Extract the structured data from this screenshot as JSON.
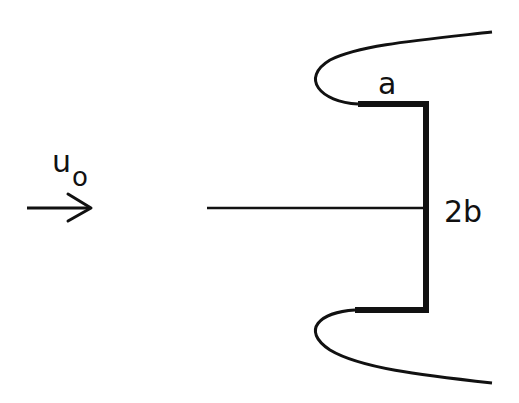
{
  "diagram": {
    "labels": {
      "velocity": "u",
      "velocity_subscript": "o",
      "plate_length": "a",
      "gap_width": "2b"
    },
    "colors": {
      "stroke": "#111111",
      "background": "#ffffff"
    }
  }
}
